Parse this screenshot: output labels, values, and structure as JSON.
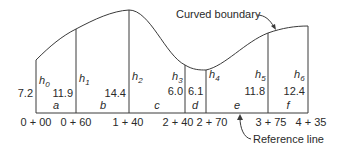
{
  "labels": {
    "curved_boundary": "Curved boundary",
    "reference_line": "Reference line"
  },
  "stations": [
    {
      "label": "0 + 00",
      "x": 36,
      "top": 60,
      "offset_label": "h",
      "offset_sub": "0",
      "value": "7.2"
    },
    {
      "label": "0 + 60",
      "x": 76,
      "top": 29,
      "offset_label": "h",
      "offset_sub": "1",
      "value": "11.9"
    },
    {
      "label": "1 + 40",
      "x": 129,
      "top": 10,
      "offset_label": "h",
      "offset_sub": "2",
      "value": "14.4"
    },
    {
      "label": "2 + 40",
      "x": 185,
      "top": 65,
      "offset_label": "h",
      "offset_sub": "3",
      "value": "6.0"
    },
    {
      "label": "2 + 70",
      "x": 206,
      "top": 70,
      "offset_label": "h",
      "offset_sub": "4",
      "value": "6.1"
    },
    {
      "label": "3 + 75",
      "x": 268,
      "top": 33,
      "offset_label": "h",
      "offset_sub": "5",
      "value": "11.8"
    },
    {
      "label": "4 + 35",
      "x": 308,
      "top": 26,
      "offset_label": "h",
      "offset_sub": "6",
      "value": "12.4"
    }
  ],
  "segments": [
    "a",
    "b",
    "c",
    "d",
    "e",
    "f"
  ],
  "colors": {
    "line": "#3a3a3a",
    "text": "#2a2a2a",
    "background": "#ffffff"
  }
}
